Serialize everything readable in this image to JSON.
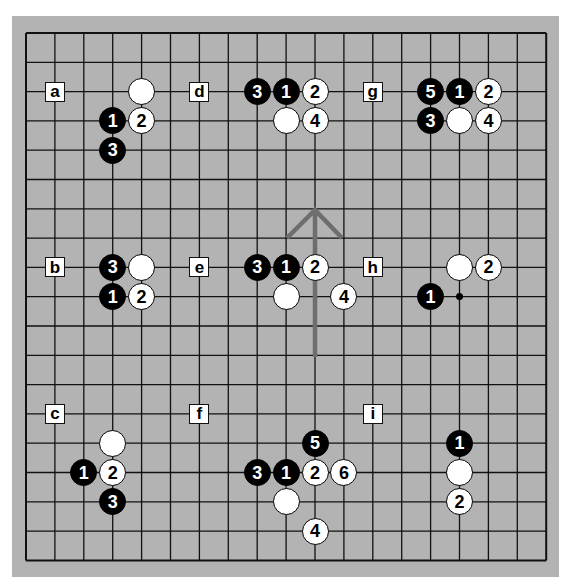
{
  "board": {
    "size": 19,
    "origin_x": 26,
    "origin_y": 33,
    "spacing_x": 28.9,
    "spacing_y": 29.3,
    "background_color": "#b3b3b3",
    "line_color": "#111111",
    "star_points_visible": [
      [
        15,
        9
      ]
    ]
  },
  "labels": [
    {
      "text": "a",
      "col": 1,
      "row": 2
    },
    {
      "text": "d",
      "col": 6,
      "row": 2
    },
    {
      "text": "g",
      "col": 12,
      "row": 2
    },
    {
      "text": "b",
      "col": 1,
      "row": 8
    },
    {
      "text": "e",
      "col": 6,
      "row": 8
    },
    {
      "text": "h",
      "col": 12,
      "row": 8
    },
    {
      "text": "c",
      "col": 1,
      "row": 13
    },
    {
      "text": "f",
      "col": 6,
      "row": 13
    },
    {
      "text": "i",
      "col": 12,
      "row": 13
    }
  ],
  "stones": [
    {
      "section": "a",
      "color": "white",
      "label": "",
      "col": 4,
      "row": 2
    },
    {
      "section": "a",
      "color": "black",
      "label": "1",
      "col": 3,
      "row": 3
    },
    {
      "section": "a",
      "color": "white",
      "label": "2",
      "col": 4,
      "row": 3
    },
    {
      "section": "a",
      "color": "black",
      "label": "3",
      "col": 3,
      "row": 4
    },
    {
      "section": "d",
      "color": "black",
      "label": "3",
      "col": 8,
      "row": 2
    },
    {
      "section": "d",
      "color": "black",
      "label": "1",
      "col": 9,
      "row": 2
    },
    {
      "section": "d",
      "color": "white",
      "label": "2",
      "col": 10,
      "row": 2
    },
    {
      "section": "d",
      "color": "white",
      "label": "",
      "col": 9,
      "row": 3
    },
    {
      "section": "d",
      "color": "white",
      "label": "4",
      "col": 10,
      "row": 3
    },
    {
      "section": "g",
      "color": "black",
      "label": "5",
      "col": 14,
      "row": 2
    },
    {
      "section": "g",
      "color": "black",
      "label": "1",
      "col": 15,
      "row": 2
    },
    {
      "section": "g",
      "color": "white",
      "label": "2",
      "col": 16,
      "row": 2
    },
    {
      "section": "g",
      "color": "black",
      "label": "3",
      "col": 14,
      "row": 3
    },
    {
      "section": "g",
      "color": "white",
      "label": "",
      "col": 15,
      "row": 3
    },
    {
      "section": "g",
      "color": "white",
      "label": "4",
      "col": 16,
      "row": 3
    },
    {
      "section": "b",
      "color": "black",
      "label": "3",
      "col": 3,
      "row": 8
    },
    {
      "section": "b",
      "color": "white",
      "label": "",
      "col": 4,
      "row": 8
    },
    {
      "section": "b",
      "color": "black",
      "label": "1",
      "col": 3,
      "row": 9
    },
    {
      "section": "b",
      "color": "white",
      "label": "2",
      "col": 4,
      "row": 9
    },
    {
      "section": "e",
      "color": "black",
      "label": "3",
      "col": 8,
      "row": 8
    },
    {
      "section": "e",
      "color": "black",
      "label": "1",
      "col": 9,
      "row": 8
    },
    {
      "section": "e",
      "color": "white",
      "label": "2",
      "col": 10,
      "row": 8
    },
    {
      "section": "e",
      "color": "white",
      "label": "",
      "col": 9,
      "row": 9
    },
    {
      "section": "e",
      "color": "white",
      "label": "4",
      "col": 11,
      "row": 9
    },
    {
      "section": "h",
      "color": "white",
      "label": "",
      "col": 15,
      "row": 8
    },
    {
      "section": "h",
      "color": "white",
      "label": "2",
      "col": 16,
      "row": 8
    },
    {
      "section": "h",
      "color": "black",
      "label": "1",
      "col": 14,
      "row": 9
    },
    {
      "section": "c",
      "color": "white",
      "label": "",
      "col": 3,
      "row": 14
    },
    {
      "section": "c",
      "color": "black",
      "label": "1",
      "col": 2,
      "row": 15
    },
    {
      "section": "c",
      "color": "white",
      "label": "2",
      "col": 3,
      "row": 15
    },
    {
      "section": "c",
      "color": "black",
      "label": "3",
      "col": 3,
      "row": 16
    },
    {
      "section": "f",
      "color": "black",
      "label": "5",
      "col": 10,
      "row": 14
    },
    {
      "section": "f",
      "color": "black",
      "label": "3",
      "col": 8,
      "row": 15
    },
    {
      "section": "f",
      "color": "black",
      "label": "1",
      "col": 9,
      "row": 15
    },
    {
      "section": "f",
      "color": "white",
      "label": "2",
      "col": 10,
      "row": 15
    },
    {
      "section": "f",
      "color": "white",
      "label": "6",
      "col": 11,
      "row": 15
    },
    {
      "section": "f",
      "color": "white",
      "label": "",
      "col": 9,
      "row": 16
    },
    {
      "section": "f",
      "color": "white",
      "label": "4",
      "col": 10,
      "row": 17
    },
    {
      "section": "i",
      "color": "black",
      "label": "1",
      "col": 15,
      "row": 14
    },
    {
      "section": "i",
      "color": "white",
      "label": "",
      "col": 15,
      "row": 15
    },
    {
      "section": "i",
      "color": "white",
      "label": "2",
      "col": 15,
      "row": 16
    }
  ],
  "arrow": {
    "direction": "up",
    "color": "#6e6e6e",
    "shaft_from": {
      "x": 315,
      "y": 357
    },
    "tip": {
      "x": 315,
      "y": 210
    },
    "wing_left": {
      "x": 287,
      "y": 238
    },
    "wing_right": {
      "x": 342,
      "y": 238
    }
  }
}
